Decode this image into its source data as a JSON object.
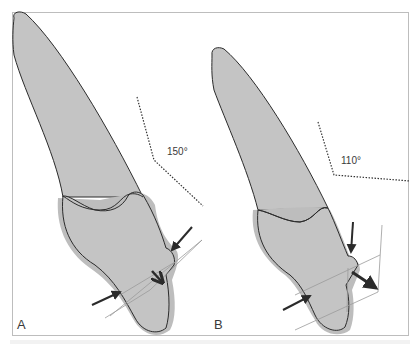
{
  "figure": {
    "panels": [
      {
        "label": "A",
        "angle_label": "150°",
        "angle_degrees": 150
      },
      {
        "label": "B",
        "angle_label": "110°",
        "angle_degrees": 110
      }
    ],
    "colors": {
      "tooth_fill": "#c4c4c4",
      "tooth_shadow": "#bdbdbd",
      "outline": "#2b2b2b",
      "arrow": "#2b2b2b",
      "guide_line": "#9a9a9a",
      "dotted_line": "#333333",
      "frame": "#bdbdbd"
    }
  }
}
